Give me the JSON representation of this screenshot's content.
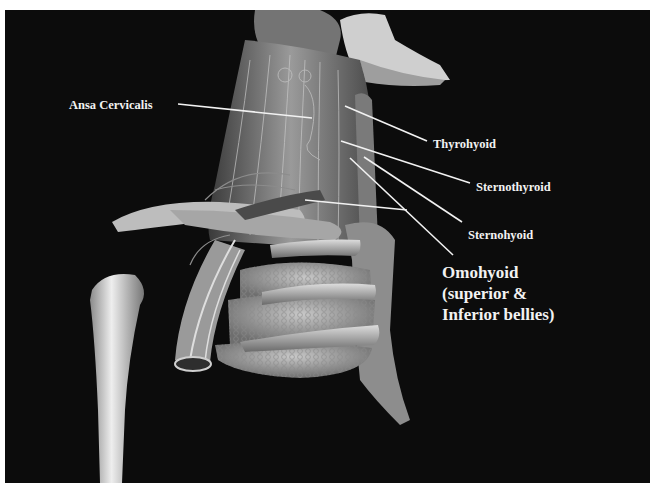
{
  "figure": {
    "background_color": "#0c0c0c",
    "label_color": "#f2f2f2",
    "labels": [
      {
        "id": "ansa",
        "text": "Ansa Cervicalis"
      },
      {
        "id": "thyrohyoid",
        "text": "Thyrohyoid"
      },
      {
        "id": "sternothyroid",
        "text": "Sternothyroid"
      },
      {
        "id": "sternohyoid",
        "text": "Sternohyoid"
      },
      {
        "id": "omohyoid",
        "lines": [
          "Omohyoid",
          "(superior &",
          "Inferior bellies)"
        ]
      }
    ]
  }
}
